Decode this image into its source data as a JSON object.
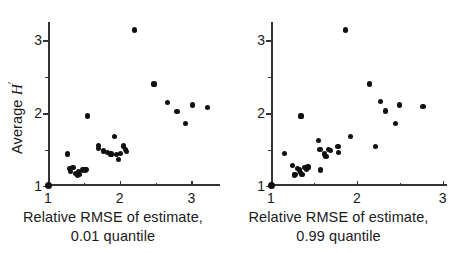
{
  "figure": {
    "ylabel_text": "Average",
    "ylabel_symbol": "H",
    "ylabel_prime": "′"
  },
  "chart_data": [
    {
      "type": "scatter",
      "panel": "left",
      "title": "",
      "xlabel": "Relative RMSE of estimate, 0.01 quantile",
      "xlabel_line1": "Relative RMSE of estimate,",
      "xlabel_line2": "0.01 quantile",
      "ylabel": "Average H′",
      "xlim": [
        1,
        3.4
      ],
      "ylim": [
        1,
        3.25
      ],
      "xticks": [
        1,
        2,
        3
      ],
      "xticklabels": [
        "1",
        "2",
        "3"
      ],
      "xminorticks": [
        1.5,
        2.5
      ],
      "yticks": [
        1,
        2,
        3
      ],
      "yticklabels": [
        "1",
        "2",
        "3"
      ],
      "yminorticks": [
        1.5,
        2.5
      ],
      "grid": false,
      "legend": "none",
      "marker": "filled-circle",
      "color": "#111111",
      "points": [
        [
          1.0,
          1.01
        ],
        [
          1.27,
          1.44
        ],
        [
          1.3,
          1.24
        ],
        [
          1.31,
          1.2
        ],
        [
          1.35,
          1.25
        ],
        [
          1.39,
          1.17
        ],
        [
          1.41,
          1.15
        ],
        [
          1.43,
          1.2
        ],
        [
          1.44,
          1.16
        ],
        [
          1.48,
          1.22
        ],
        [
          1.5,
          1.23
        ],
        [
          1.52,
          1.22
        ],
        [
          1.53,
          1.23
        ],
        [
          1.55,
          1.96
        ],
        [
          1.7,
          1.56
        ],
        [
          1.71,
          1.51
        ],
        [
          1.78,
          1.48
        ],
        [
          1.83,
          1.46
        ],
        [
          1.88,
          1.44
        ],
        [
          1.93,
          1.68
        ],
        [
          1.96,
          1.43
        ],
        [
          1.98,
          1.36
        ],
        [
          2.01,
          1.45
        ],
        [
          2.05,
          1.55
        ],
        [
          2.08,
          1.5
        ],
        [
          2.1,
          1.47
        ],
        [
          2.21,
          3.14
        ],
        [
          2.48,
          2.4
        ],
        [
          2.67,
          2.15
        ],
        [
          2.8,
          2.02
        ],
        [
          2.92,
          1.86
        ],
        [
          3.02,
          2.11
        ],
        [
          3.23,
          2.08
        ]
      ]
    },
    {
      "type": "scatter",
      "panel": "right",
      "title": "",
      "xlabel": "Relative RMSE of estimate, 0.99 quantile",
      "xlabel_line1": "Relative RMSE of estimate,",
      "xlabel_line2": "0.99 quantile",
      "ylabel": "Average H′",
      "xlim": [
        1,
        3.05
      ],
      "ylim": [
        1,
        3.25
      ],
      "xticks": [
        1,
        2,
        3
      ],
      "xticklabels": [
        "1",
        "2",
        "3"
      ],
      "xminorticks": [
        1.5,
        2.5
      ],
      "yticks": [
        1,
        2,
        3
      ],
      "yticklabels": [
        "1",
        "2",
        "3"
      ],
      "yminorticks": [
        1.5,
        2.5
      ],
      "grid": false,
      "legend": "none",
      "marker": "filled-circle",
      "color": "#111111",
      "points": [
        [
          1.0,
          1.01
        ],
        [
          1.16,
          1.45
        ],
        [
          1.25,
          1.28
        ],
        [
          1.27,
          1.15
        ],
        [
          1.28,
          1.16
        ],
        [
          1.31,
          1.24
        ],
        [
          1.33,
          1.22
        ],
        [
          1.34,
          1.19
        ],
        [
          1.35,
          1.96
        ],
        [
          1.36,
          1.16
        ],
        [
          1.39,
          1.25
        ],
        [
          1.41,
          1.23
        ],
        [
          1.43,
          1.26
        ],
        [
          1.55,
          1.62
        ],
        [
          1.57,
          1.5
        ],
        [
          1.58,
          1.22
        ],
        [
          1.62,
          1.44
        ],
        [
          1.64,
          1.41
        ],
        [
          1.67,
          1.5
        ],
        [
          1.69,
          1.49
        ],
        [
          1.78,
          1.54
        ],
        [
          1.79,
          1.46
        ],
        [
          1.87,
          3.14
        ],
        [
          1.93,
          1.68
        ],
        [
          2.15,
          2.4
        ],
        [
          2.22,
          1.54
        ],
        [
          2.28,
          2.16
        ],
        [
          2.33,
          2.03
        ],
        [
          2.45,
          1.86
        ],
        [
          2.5,
          2.11
        ],
        [
          2.77,
          2.09
        ]
      ]
    }
  ]
}
